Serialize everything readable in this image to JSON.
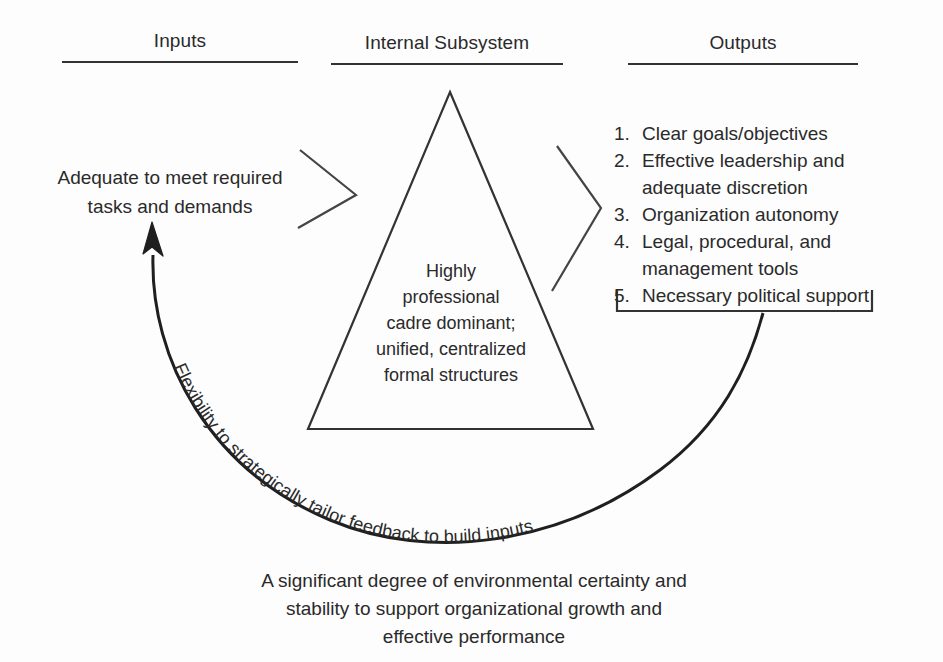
{
  "figure": {
    "background_color": "#fdfdfd",
    "line_color": "#333333",
    "text_color": "#2a2a2a"
  },
  "columns": {
    "inputs_header": "Inputs",
    "internal_header": "Internal Subsystem",
    "outputs_header": "Outputs"
  },
  "inputs": {
    "line1": "Adequate to meet required",
    "line2": "tasks and demands"
  },
  "internal": {
    "line1": "Highly",
    "line2": "professional",
    "line3": "cadre dominant;",
    "line4": "unified, centralized",
    "line5": "formal structures"
  },
  "outputs": {
    "items": [
      {
        "num": "1.",
        "text": "Clear goals/objectives"
      },
      {
        "num": "2.",
        "text": "Effective leadership and"
      },
      {
        "num": "",
        "text": "adequate discretion"
      },
      {
        "num": "3.",
        "text": "Organization autonomy"
      },
      {
        "num": "4.",
        "text": "Legal, procedural, and"
      },
      {
        "num": "",
        "text": "management tools"
      },
      {
        "num": "5.",
        "text": "Necessary political support"
      }
    ]
  },
  "feedback": {
    "curved_label": "Flexibility to strategically tailor feedback to build inputs"
  },
  "caption": {
    "line1": "A significant degree of environmental certainty and",
    "line2": "stability to support organizational growth and",
    "line3": "effective performance"
  },
  "shapes": {
    "triangle": "internal-subsystem-triangle",
    "left_chevron": "inputs-flow-arrow",
    "right_chevron": "outputs-flow-arrow",
    "bracket": "outputs-grouping-bracket",
    "feedback_arc": "feedback-loop-arrow"
  }
}
